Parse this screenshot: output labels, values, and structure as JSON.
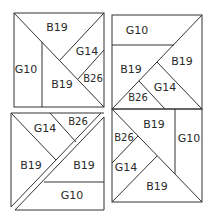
{
  "diagram": {
    "type": "quilt-block-layout",
    "blocks": [
      {
        "position": "top-left",
        "patches": [
          {
            "label": "B19"
          },
          {
            "label": "G10"
          },
          {
            "label": "G14"
          },
          {
            "label": "B19"
          },
          {
            "label": "B26"
          }
        ]
      },
      {
        "position": "top-right",
        "patches": [
          {
            "label": "G10"
          },
          {
            "label": "B19"
          },
          {
            "label": "B19"
          },
          {
            "label": "G14"
          },
          {
            "label": "B26"
          }
        ]
      },
      {
        "position": "bottom-left",
        "patches": [
          {
            "label": "G14"
          },
          {
            "label": "B26"
          },
          {
            "label": "B19"
          },
          {
            "label": "B19"
          },
          {
            "label": "G10"
          }
        ]
      },
      {
        "position": "bottom-right",
        "patches": [
          {
            "label": "B19"
          },
          {
            "label": "B26"
          },
          {
            "label": "G10"
          },
          {
            "label": "G14"
          },
          {
            "label": "B19"
          }
        ]
      }
    ],
    "line_color": "#333333",
    "background": "#ffffff"
  }
}
